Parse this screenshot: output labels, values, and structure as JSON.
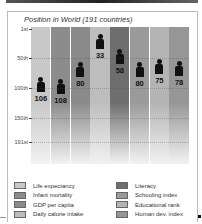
{
  "chart_data": {
    "type": "scatter",
    "title": "Position in World (191 countries)",
    "xlabel": "",
    "ylabel": "Rank",
    "y_axis_inverted": true,
    "ylim": [
      1,
      191
    ],
    "yticks": [
      "1st",
      "50th",
      "100th",
      "150th",
      "191st"
    ],
    "grid": true,
    "categories": [
      "Life expectancy",
      "Infant mortality",
      "GDP per capita",
      "Daily calorie intake",
      "Literacy",
      "Schooling index",
      "Educational rank",
      "Human dev. index"
    ],
    "values": [
      106,
      108,
      80,
      33,
      58,
      80,
      75,
      78
    ],
    "colors": [
      "#c8c8c8",
      "#8c8c8c",
      "#8a8a8a",
      "#bdbdbd",
      "#6e6e6e",
      "#9a9a9a",
      "#b4b4b4",
      "#969696"
    ],
    "marker": "person-icon",
    "legend_position": "bottom"
  },
  "yticks": [
    {
      "label": "1st",
      "rank": 1
    },
    {
      "label": "50th",
      "rank": 50
    },
    {
      "label": "100th",
      "rank": 100
    },
    {
      "label": "150th",
      "rank": 150
    },
    {
      "label": "191st",
      "rank": 191
    }
  ],
  "columns": [
    {
      "label": "Life expectancy",
      "value": "106",
      "color": "#c8c8c8"
    },
    {
      "label": "Infant mortality",
      "value": "108",
      "color": "#8c8c8c"
    },
    {
      "label": "GDP per capita",
      "value": "80",
      "color": "#8a8a8a"
    },
    {
      "label": "Daily calorie intake",
      "value": "33",
      "color": "#bdbdbd"
    },
    {
      "label": "Literacy",
      "value": "58",
      "color": "#6e6e6e"
    },
    {
      "label": "Schooling index",
      "value": "80",
      "color": "#9a9a9a"
    },
    {
      "label": "Educational rank",
      "value": "75",
      "color": "#b4b4b4"
    },
    {
      "label": "Human dev. index",
      "value": "78",
      "color": "#969696"
    }
  ]
}
